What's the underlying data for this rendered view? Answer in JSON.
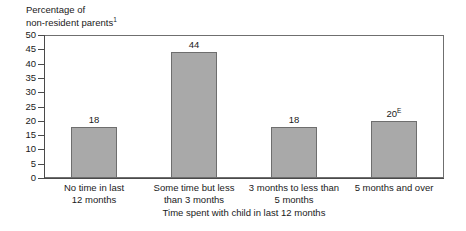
{
  "chart_data": {
    "type": "bar",
    "title": "",
    "subtitle": "",
    "ylabel_line1": "Percentage of",
    "ylabel_line2": "non-resident parents",
    "ylabel_footnote": "1",
    "xlabel": "Time spent with child in last 12 months",
    "categories": [
      "No time in last 12 months",
      "Some time but less than 3 months",
      "3 months to less than 5 months",
      "5 months and over"
    ],
    "category_lines": [
      [
        "No time in last",
        "12 months"
      ],
      [
        "Some time but less",
        "than 3 months"
      ],
      [
        "3 months to less than",
        "5 months"
      ],
      [
        "5 months and over"
      ]
    ],
    "values": [
      18,
      44,
      18,
      20
    ],
    "value_labels": [
      "18",
      "44",
      "18",
      "20"
    ],
    "value_label_superscripts": [
      "",
      "",
      "",
      "E"
    ],
    "ylim": [
      0,
      50
    ],
    "ytick_values": [
      0,
      5,
      10,
      15,
      20,
      25,
      30,
      35,
      40,
      45,
      50
    ],
    "ytick_labels": [
      "0",
      "5",
      "10",
      "15",
      "20",
      "25",
      "30",
      "35",
      "40",
      "45",
      "50"
    ],
    "grid": false,
    "legend": "none",
    "bar_color": "#a9a9a9",
    "bar_border_color": "#6e6e6e",
    "axis_color": "#4a4a4a",
    "text_color": "#1a1a1a"
  }
}
